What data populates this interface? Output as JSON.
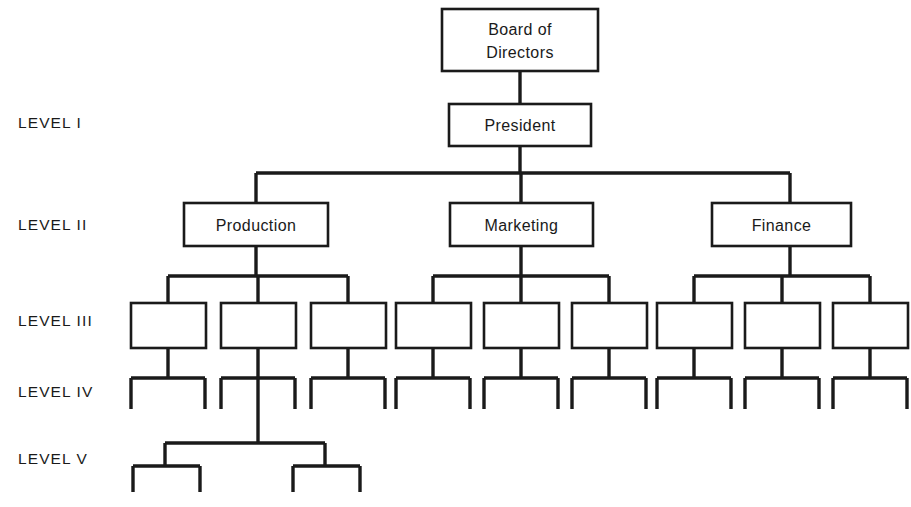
{
  "diagram": {
    "background_color": "#ffffff",
    "line_color": "#1a1a1a",
    "text_color": "#1a1a1a",
    "width": 911,
    "height": 507
  },
  "level_labels": [
    {
      "id": "level-1",
      "text": "LEVEL I",
      "x": 18,
      "y": 128
    },
    {
      "id": "level-2",
      "text": "LEVEL II",
      "x": 18,
      "y": 230
    },
    {
      "id": "level-3",
      "text": "LEVEL III",
      "x": 18,
      "y": 326
    },
    {
      "id": "level-4",
      "text": "LEVEL IV",
      "x": 18,
      "y": 397
    },
    {
      "id": "level-5",
      "text": "LEVEL V",
      "x": 18,
      "y": 464
    }
  ],
  "named_nodes": [
    {
      "id": "board-of-directors",
      "name": "board-of-directors-box",
      "lines": [
        "Board of",
        "Directors"
      ],
      "x": 442,
      "y": 9,
      "w": 156,
      "h": 62,
      "level": 0
    },
    {
      "id": "president",
      "name": "president-box",
      "lines": [
        "President"
      ],
      "x": 449,
      "y": 104,
      "w": 142,
      "h": 42,
      "level": 1
    },
    {
      "id": "production",
      "name": "production-box",
      "lines": [
        "Production"
      ],
      "x": 184,
      "y": 203,
      "w": 144,
      "h": 43,
      "level": 2
    },
    {
      "id": "marketing",
      "name": "marketing-box",
      "lines": [
        "Marketing"
      ],
      "x": 450,
      "y": 203,
      "w": 143,
      "h": 43,
      "level": 2
    },
    {
      "id": "finance",
      "name": "finance-box",
      "lines": [
        "Finance"
      ],
      "x": 712,
      "y": 203,
      "w": 139,
      "h": 43,
      "level": 2
    }
  ],
  "unlabeled_nodes": [
    {
      "id": "l3-p1",
      "name": "level3-box-production-1",
      "x": 131,
      "y": 303,
      "w": 75,
      "h": 45,
      "parent": "production",
      "level": 3
    },
    {
      "id": "l3-p2",
      "name": "level3-box-production-2",
      "x": 221,
      "y": 303,
      "w": 75,
      "h": 45,
      "parent": "production",
      "level": 3
    },
    {
      "id": "l3-p3",
      "name": "level3-box-production-3",
      "x": 311,
      "y": 303,
      "w": 75,
      "h": 45,
      "parent": "production",
      "level": 3
    },
    {
      "id": "l3-m1",
      "name": "level3-box-marketing-1",
      "x": 396,
      "y": 303,
      "w": 75,
      "h": 45,
      "parent": "marketing",
      "level": 3
    },
    {
      "id": "l3-m2",
      "name": "level3-box-marketing-2",
      "x": 484,
      "y": 303,
      "w": 75,
      "h": 45,
      "parent": "marketing",
      "level": 3
    },
    {
      "id": "l3-m3",
      "name": "level3-box-marketing-3",
      "x": 572,
      "y": 303,
      "w": 75,
      "h": 45,
      "parent": "marketing",
      "level": 3
    },
    {
      "id": "l3-f1",
      "name": "level3-box-finance-1",
      "x": 657,
      "y": 303,
      "w": 75,
      "h": 45,
      "parent": "finance",
      "level": 3
    },
    {
      "id": "l3-f2",
      "name": "level3-box-finance-2",
      "x": 745,
      "y": 303,
      "w": 75,
      "h": 45,
      "parent": "finance",
      "level": 3
    },
    {
      "id": "l3-f3",
      "name": "level3-box-finance-3",
      "x": 833,
      "y": 303,
      "w": 75,
      "h": 45,
      "parent": "finance",
      "level": 3
    }
  ],
  "chart_data": {
    "type": "diagram",
    "diagram_type": "organizational-hierarchy-tree",
    "levels": [
      {
        "label": "",
        "depth": 0,
        "node_count": 1,
        "nodes": [
          "Board of Directors"
        ]
      },
      {
        "label": "LEVEL I",
        "depth": 1,
        "node_count": 1,
        "nodes": [
          "President"
        ]
      },
      {
        "label": "LEVEL II",
        "depth": 2,
        "node_count": 3,
        "nodes": [
          "Production",
          "Marketing",
          "Finance"
        ]
      },
      {
        "label": "LEVEL III",
        "depth": 3,
        "node_count": 9,
        "nodes": []
      },
      {
        "label": "LEVEL IV",
        "depth": 4,
        "node_count": 18,
        "nodes": []
      },
      {
        "label": "LEVEL V",
        "depth": 5,
        "node_count": 4,
        "nodes": []
      }
    ],
    "edges": [
      {
        "from": "Board of Directors",
        "to": "President"
      },
      {
        "from": "President",
        "to": "Production"
      },
      {
        "from": "President",
        "to": "Marketing"
      },
      {
        "from": "President",
        "to": "Finance"
      },
      {
        "from": "Production",
        "to": "Level III box 1"
      },
      {
        "from": "Production",
        "to": "Level III box 2"
      },
      {
        "from": "Production",
        "to": "Level III box 3"
      },
      {
        "from": "Marketing",
        "to": "Level III box 4"
      },
      {
        "from": "Marketing",
        "to": "Level III box 5"
      },
      {
        "from": "Marketing",
        "to": "Level III box 6"
      },
      {
        "from": "Finance",
        "to": "Level III box 7"
      },
      {
        "from": "Finance",
        "to": "Level III box 8"
      },
      {
        "from": "Finance",
        "to": "Level III box 9"
      },
      {
        "from": "Level III box 2",
        "to": "Level V cluster"
      }
    ]
  },
  "connectors": {
    "board_to_president": {
      "name": "edge-board-to-president",
      "path": "M520,71 L520,104"
    },
    "president_down": {
      "name": "edge-president-stem",
      "path": "M520,146 L520,173"
    },
    "level2_bus": {
      "name": "level2-horizontal-bus",
      "path": "M256,173 L790,173"
    },
    "level2_drops": [
      {
        "name": "edge-bus-to-production",
        "path": "M256,173 L256,203"
      },
      {
        "name": "edge-bus-to-marketing",
        "path": "M521,173 L521,203"
      },
      {
        "name": "edge-bus-to-finance",
        "path": "M790,173 L790,203"
      }
    ],
    "level2_stems": [
      {
        "name": "edge-production-stem",
        "path": "M256,246 L256,276"
      },
      {
        "name": "edge-marketing-stem",
        "path": "M521,246 L521,276"
      },
      {
        "name": "edge-finance-stem",
        "path": "M790,246 L790,276"
      }
    ],
    "level3_buses": [
      {
        "name": "level3-bus-production",
        "path": "M168,276 L348,276"
      },
      {
        "name": "level3-bus-marketing",
        "path": "M433,276 L609,276"
      },
      {
        "name": "level3-bus-finance",
        "path": "M694,276 L870,276"
      }
    ],
    "level3_drops": [
      {
        "name": "edge-to-l3-p1",
        "path": "M168,276 L168,303"
      },
      {
        "name": "edge-to-l3-p2",
        "path": "M258,276 L258,303"
      },
      {
        "name": "edge-to-l3-p3",
        "path": "M348,276 L348,303"
      },
      {
        "name": "edge-to-l3-m1",
        "path": "M433,276 L433,303"
      },
      {
        "name": "edge-to-l3-m2",
        "path": "M521,276 L521,303"
      },
      {
        "name": "edge-to-l3-m3",
        "path": "M609,276 L609,303"
      },
      {
        "name": "edge-to-l3-f1",
        "path": "M694,276 L694,303"
      },
      {
        "name": "edge-to-l3-f2",
        "path": "M782,276 L782,303"
      },
      {
        "name": "edge-to-l3-f3",
        "path": "M870,276 L870,303"
      }
    ],
    "level4_groups": [
      {
        "name": "level4-group-1",
        "center": 168,
        "path": "M168,348 L168,378 M131,378 L205,378 M131,378 L131,409 M205,378 L205,409"
      },
      {
        "name": "level4-group-2",
        "center": 258,
        "path": "M258,348 L258,378 M221,378 L295,378 M221,378 L221,409 M295,378 L295,409"
      },
      {
        "name": "level4-group-3",
        "center": 348,
        "path": "M348,348 L348,378 M311,378 L385,378 M311,378 L311,409 M385,378 L385,409"
      },
      {
        "name": "level4-group-4",
        "center": 433,
        "path": "M433,348 L433,378 M396,378 L470,378 M396,378 L396,409 M470,378 L470,409"
      },
      {
        "name": "level4-group-5",
        "center": 521,
        "path": "M521,348 L521,378 M484,378 L558,378 M484,378 L484,409 M558,378 L558,409"
      },
      {
        "name": "level4-group-6",
        "center": 609,
        "path": "M609,348 L609,378 M572,378 L646,378 M572,378 L572,409 M646,378 L646,409"
      },
      {
        "name": "level4-group-7",
        "center": 694,
        "path": "M694,348 L694,378 M657,378 L731,378 M657,378 L657,409 M731,378 L731,409"
      },
      {
        "name": "level4-group-8",
        "center": 782,
        "path": "M782,348 L782,378 M745,378 L819,378 M745,378 L745,409 M819,378 L819,409"
      },
      {
        "name": "level4-group-9",
        "center": 870,
        "path": "M870,348 L870,378 M833,378 L907,378 M833,378 L833,409 M907,378 L907,409"
      }
    ],
    "level5_stem": {
      "name": "level5-stem-from-l3-p2",
      "path": "M258,378 L258,443"
    },
    "level5_bus": {
      "name": "level5-horizontal-bus",
      "path": "M165,443 L325,443"
    },
    "level5_groups": [
      {
        "name": "level5-group-1",
        "path": "M165,443 L165,466 M133,466 L200,466 M133,466 L133,492 M200,466 L200,492"
      },
      {
        "name": "level5-group-2",
        "path": "M325,443 L325,466 M293,466 L360,466 M293,466 L293,492 M360,466 L360,492"
      }
    ]
  }
}
